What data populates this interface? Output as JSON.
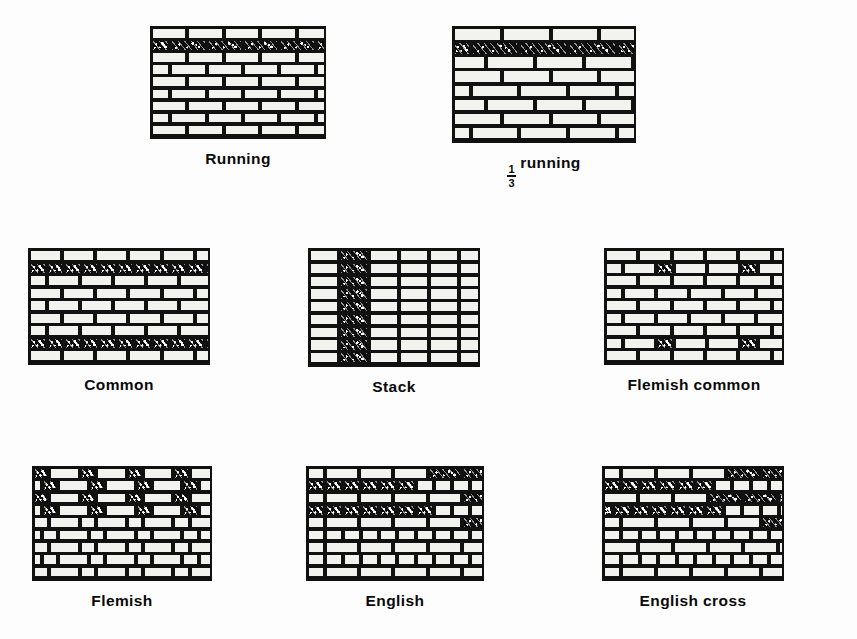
{
  "figure": {
    "background_color": "#fdfdfd",
    "ink_color": "#111111",
    "brick_face_color": "#f2f2ef",
    "dark_brick_color": "#0d0d0d"
  },
  "panels": [
    {
      "id": "running",
      "caption": "Running",
      "caption_prefix_fraction": null,
      "x": 150,
      "y": 26,
      "w": 176,
      "h": 113,
      "rows": 9,
      "pattern": "running",
      "description": "Stretcher (running) bond: each course offset one half brick; one dark scribbled header course near the top"
    },
    {
      "id": "third-running",
      "caption": "running",
      "caption_prefix_fraction": {
        "numerator": "1",
        "denominator": "3"
      },
      "x": 452,
      "y": 26,
      "w": 184,
      "h": 117,
      "rows": 8,
      "pattern": "third-running",
      "description": "One-third running bond: each course offset one third of a brick; one dark scribbled course near the top"
    },
    {
      "id": "common",
      "caption": "Common",
      "caption_prefix_fraction": null,
      "x": 28,
      "y": 248,
      "w": 182,
      "h": 117,
      "rows": 9,
      "pattern": "common",
      "description": "Common (American) bond: full dark header courses at course 2 and course 8, stretchers between"
    },
    {
      "id": "stack",
      "caption": "Stack",
      "caption_prefix_fraction": null,
      "x": 308,
      "y": 248,
      "w": 172,
      "h": 119,
      "rows": 9,
      "pattern": "stack",
      "description": "Stack bond: bricks aligned in a straight grid with continuous vertical joints; second column drawn dark"
    },
    {
      "id": "flemish-common",
      "caption": "Flemish common",
      "caption_prefix_fraction": null,
      "x": 604,
      "y": 248,
      "w": 180,
      "h": 117,
      "rows": 9,
      "pattern": "flemish-common",
      "description": "Flemish common bond: running bond with occasional dark headers inserted in courses 2 and 8"
    },
    {
      "id": "flemish",
      "caption": "Flemish",
      "caption_prefix_fraction": null,
      "x": 32,
      "y": 466,
      "w": 180,
      "h": 115,
      "rows": 9,
      "pattern": "flemish",
      "description": "Flemish bond: every course alternates a header and a stretcher; upper courses drawn with dark headers"
    },
    {
      "id": "english",
      "caption": "English",
      "caption_prefix_fraction": null,
      "x": 306,
      "y": 466,
      "w": 178,
      "h": 115,
      "rows": 9,
      "pattern": "english",
      "description": "English bond: alternating full courses of headers and stretchers; upper-left headers drawn dark"
    },
    {
      "id": "english-cross",
      "caption": "English cross",
      "caption_prefix_fraction": null,
      "x": 602,
      "y": 466,
      "w": 182,
      "h": 115,
      "rows": 9,
      "pattern": "english-cross",
      "description": "English cross bond: alternating header and stretcher courses with stretchers offset half a brick each repeat"
    }
  ]
}
